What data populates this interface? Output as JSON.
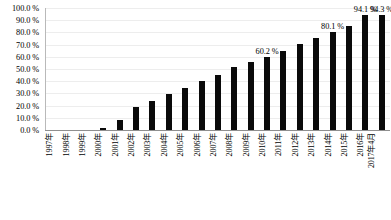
{
  "chart_data": {
    "type": "bar",
    "title": "",
    "subtitle": "",
    "xlabel": "",
    "ylabel": "",
    "ylim": [
      0,
      100
    ],
    "grid": true,
    "legend": false,
    "legend_position": "none",
    "y_tick_labels": [
      "100.0 %",
      "90.0 %",
      "80.0 %",
      "70.0 %",
      "60.0 %",
      "50.0 %",
      "40.0 %",
      "30.0 %",
      "20.0 %",
      "10.0 %",
      "0.0 %"
    ],
    "y_ticks": [
      100,
      90,
      80,
      70,
      60,
      50,
      40,
      30,
      20,
      10,
      0
    ],
    "categories": [
      "1997年",
      "1998年",
      "1999年",
      "2000年",
      "2001年",
      "2002年",
      "2003年",
      "2004年",
      "2005年",
      "2006年",
      "2007年",
      "2008年",
      "2009年",
      "2010年",
      "2011年",
      "2012年",
      "2013年",
      "2014年",
      "2015年",
      "2016年",
      "2017年4月"
    ],
    "values": [
      0.0,
      0.0,
      0.0,
      1.8,
      8.5,
      18.5,
      24.0,
      29.5,
      34.5,
      40.0,
      45.5,
      52.0,
      56.0,
      60.2,
      65.0,
      70.5,
      75.5,
      80.1,
      85.0,
      94.1,
      94.3
    ],
    "data_labels": [
      {
        "category": "2010年",
        "text": "60.2 %"
      },
      {
        "category": "2014年",
        "text": "80.1 %"
      },
      {
        "category": "2016年",
        "text": "94.1 %"
      },
      {
        "category": "2017年4月",
        "text": "94.3 %"
      }
    ],
    "bar_color": "#0a0a0a",
    "gridline_color": "#ededed",
    "axis_color": "#8f8f8f",
    "background_color": "#ffffff"
  }
}
